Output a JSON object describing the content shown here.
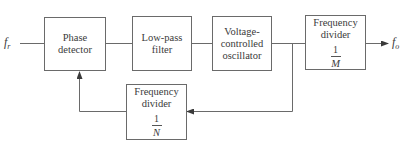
{
  "diagram": {
    "type": "phase-locked loop frequency synthesizer block diagram",
    "input": {
      "symbol": "f",
      "subscript": "r"
    },
    "output": {
      "symbol": "f",
      "subscript": "o"
    },
    "blocks": {
      "phase_detector": {
        "label": "Phase detector"
      },
      "low_pass_filter": {
        "line1": "Low-pass",
        "line2": "filter"
      },
      "vco": {
        "line1": "Voltage-",
        "line2": "controlled",
        "line3": "oscillator"
      },
      "divider_m": {
        "line1": "Frequency",
        "line2": "divider",
        "numerator": "1",
        "denominator": "M"
      },
      "divider_n": {
        "line1": "Frequency",
        "line2": "divider",
        "numerator": "1",
        "denominator": "N"
      }
    },
    "colors": {
      "line": "#6a6a6a",
      "text": "#3a3a3a",
      "background": "#ffffff"
    }
  }
}
